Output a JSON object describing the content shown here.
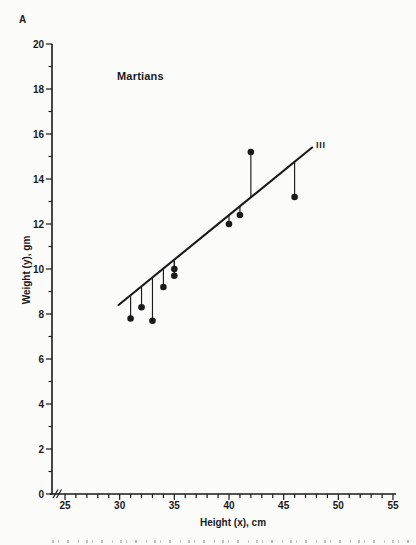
{
  "page": {
    "background": "#fbfbf9",
    "ink_color": "#1a1a1a"
  },
  "panel_label": "A",
  "chart_data": {
    "type": "scatter",
    "title": "Martians",
    "annotation_line_label": "III",
    "xlabel": "Height (x), cm",
    "ylabel": "Weight (y), gm",
    "xlim": [
      25,
      55
    ],
    "ylim": [
      0,
      20
    ],
    "x_major_ticks": [
      25,
      30,
      35,
      40,
      45,
      50,
      55
    ],
    "x_minor_step": 1,
    "y_major_ticks": [
      0,
      2,
      4,
      6,
      8,
      10,
      12,
      14,
      16,
      18,
      20
    ],
    "y_minor_step": 1,
    "x_axis_break_before_first_tick": true,
    "grid": false,
    "legend": "none",
    "points": [
      {
        "x": 31,
        "y": 7.8
      },
      {
        "x": 32,
        "y": 8.3
      },
      {
        "x": 33,
        "y": 7.7
      },
      {
        "x": 34,
        "y": 9.2
      },
      {
        "x": 35,
        "y": 9.7
      },
      {
        "x": 35,
        "y": 10.0
      },
      {
        "x": 40,
        "y": 12.0
      },
      {
        "x": 41,
        "y": 12.4
      },
      {
        "x": 42,
        "y": 15.2
      },
      {
        "x": 46,
        "y": 13.2
      }
    ],
    "regression_line": {
      "x1": 29.9,
      "y1": 8.4,
      "x2": 47.6,
      "y2": 15.4
    },
    "show_residual_stems": true
  }
}
